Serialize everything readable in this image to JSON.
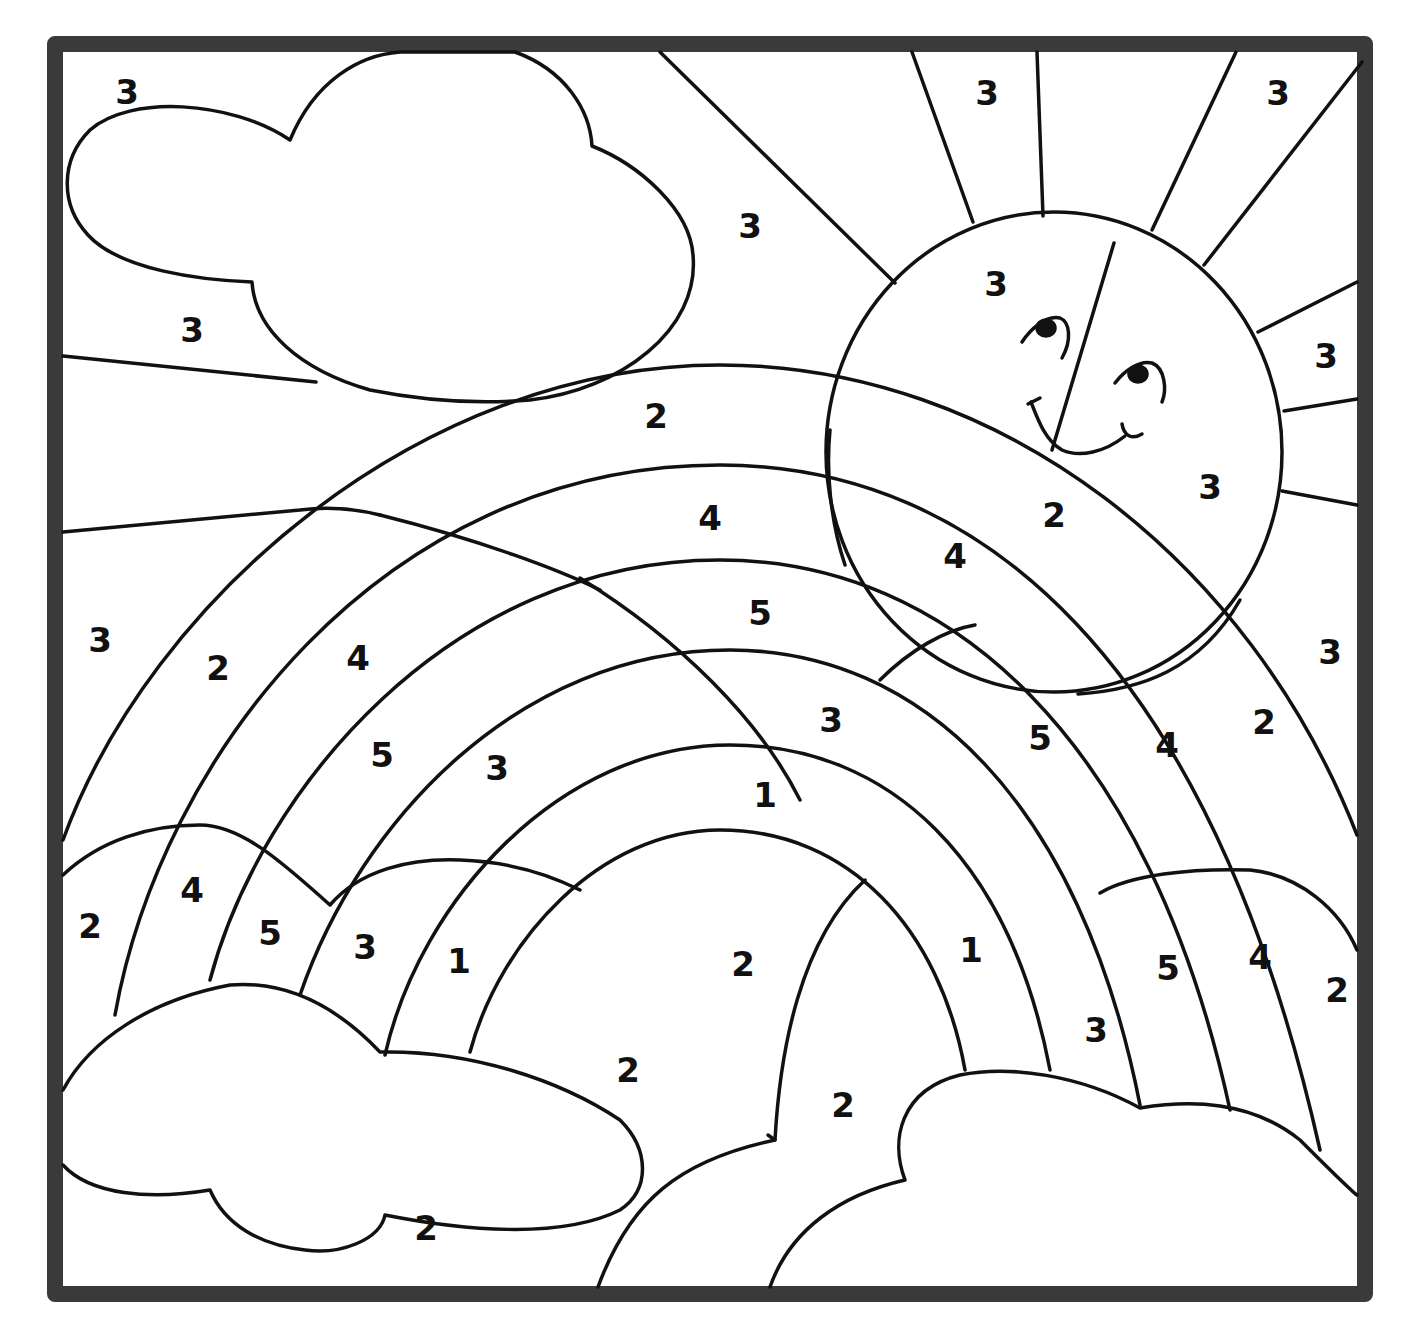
{
  "worksheet": {
    "type": "color-by-number",
    "subject": "rainbow with sun and clouds",
    "frame_color": "#3a3a3a",
    "line_color": "#111111",
    "background": "#ffffff"
  },
  "numbers": [
    {
      "v": "3",
      "x": 127,
      "y": 92
    },
    {
      "v": "3",
      "x": 750,
      "y": 226
    },
    {
      "v": "3",
      "x": 192,
      "y": 330
    },
    {
      "v": "3",
      "x": 987,
      "y": 93
    },
    {
      "v": "3",
      "x": 1278,
      "y": 93
    },
    {
      "v": "3",
      "x": 996,
      "y": 284
    },
    {
      "v": "3",
      "x": 1326,
      "y": 356
    },
    {
      "v": "3",
      "x": 1210,
      "y": 487
    },
    {
      "v": "3",
      "x": 1330,
      "y": 652
    },
    {
      "v": "2",
      "x": 656,
      "y": 416
    },
    {
      "v": "4",
      "x": 710,
      "y": 518
    },
    {
      "v": "2",
      "x": 1054,
      "y": 515
    },
    {
      "v": "4",
      "x": 955,
      "y": 556
    },
    {
      "v": "5",
      "x": 760,
      "y": 613
    },
    {
      "v": "3",
      "x": 100,
      "y": 640
    },
    {
      "v": "2",
      "x": 218,
      "y": 668
    },
    {
      "v": "4",
      "x": 358,
      "y": 658
    },
    {
      "v": "5",
      "x": 382,
      "y": 755
    },
    {
      "v": "3",
      "x": 497,
      "y": 768
    },
    {
      "v": "3",
      "x": 831,
      "y": 720
    },
    {
      "v": "5",
      "x": 1040,
      "y": 738
    },
    {
      "v": "4",
      "x": 1167,
      "y": 745
    },
    {
      "v": "2",
      "x": 1264,
      "y": 722
    },
    {
      "v": "1",
      "x": 765,
      "y": 795
    },
    {
      "v": "2",
      "x": 90,
      "y": 926
    },
    {
      "v": "4",
      "x": 192,
      "y": 890
    },
    {
      "v": "5",
      "x": 270,
      "y": 933
    },
    {
      "v": "3",
      "x": 365,
      "y": 947
    },
    {
      "v": "1",
      "x": 459,
      "y": 961
    },
    {
      "v": "2",
      "x": 743,
      "y": 964
    },
    {
      "v": "1",
      "x": 971,
      "y": 950
    },
    {
      "v": "5",
      "x": 1168,
      "y": 968
    },
    {
      "v": "4",
      "x": 1260,
      "y": 957
    },
    {
      "v": "2",
      "x": 1337,
      "y": 990
    },
    {
      "v": "3",
      "x": 1096,
      "y": 1030
    },
    {
      "v": "2",
      "x": 628,
      "y": 1070
    },
    {
      "v": "2",
      "x": 843,
      "y": 1105
    },
    {
      "v": "2",
      "x": 426,
      "y": 1228
    }
  ]
}
